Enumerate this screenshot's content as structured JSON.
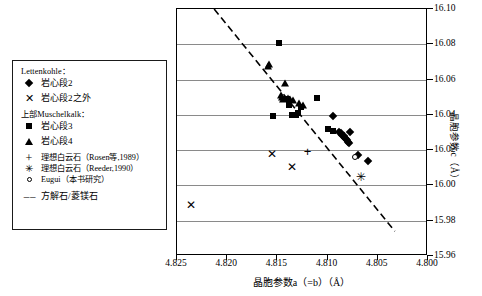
{
  "chart_data": {
    "type": "scatter",
    "title": "",
    "xlabel": "晶胞参数a（=b）（Å）",
    "ylabel": "晶胞参数c（Å）",
    "xlim": [
      4.825,
      4.8
    ],
    "ylim": [
      15.96,
      16.1
    ],
    "x_reversed": true,
    "xticks": [
      "4.825",
      "4.820",
      "4.815",
      "4.810",
      "4.805",
      "4.800"
    ],
    "xtick_values": [
      4.825,
      4.82,
      4.815,
      4.81,
      4.805,
      4.8
    ],
    "yticks": [
      "16.10",
      "16.08",
      "16.06",
      "16.04",
      "16.02",
      "16.00",
      "15.98",
      "15.96"
    ],
    "ytick_values": [
      16.1,
      16.08,
      16.06,
      16.04,
      16.02,
      16.0,
      15.98,
      15.96
    ],
    "grid": "horizontal",
    "legend_position": "outside-left",
    "series": [
      {
        "name": "岩心段2",
        "marker": "diamond",
        "points": [
          [
            4.8095,
            16.0395
          ],
          [
            4.8089,
            16.0305
          ],
          [
            4.8087,
            16.0295
          ],
          [
            4.8086,
            16.0288
          ],
          [
            4.8085,
            16.0282
          ],
          [
            4.8084,
            16.0278
          ],
          [
            4.8083,
            16.0268
          ],
          [
            4.8082,
            16.0262
          ],
          [
            4.8081,
            16.0255
          ],
          [
            4.808,
            16.0248
          ],
          [
            4.8079,
            16.0242
          ],
          [
            4.8078,
            16.0305
          ],
          [
            4.807,
            16.0175
          ],
          [
            4.806,
            16.014
          ]
        ]
      },
      {
        "name": "岩心段2之外",
        "marker": "x",
        "points": [
          [
            4.8155,
            16.0178
          ],
          [
            4.8135,
            16.0107
          ],
          [
            4.8236,
            15.9887
          ]
        ]
      },
      {
        "name": "岩心段3",
        "marker": "square",
        "points": [
          [
            4.8148,
            16.0805
          ],
          [
            4.8154,
            16.0396
          ],
          [
            4.8135,
            16.0398
          ],
          [
            4.8131,
            16.04
          ],
          [
            4.8129,
            16.0408
          ],
          [
            4.8126,
            16.0447
          ],
          [
            4.8138,
            16.0455
          ],
          [
            4.814,
            16.049
          ],
          [
            4.8111,
            16.0498
          ],
          [
            4.81,
            16.032
          ],
          [
            4.8095,
            16.0308
          ]
        ]
      },
      {
        "name": "岩心段4",
        "marker": "triangle",
        "points": [
          [
            4.8158,
            16.069
          ],
          [
            4.8159,
            16.0675
          ],
          [
            4.8142,
            16.058
          ],
          [
            4.8146,
            16.051
          ],
          [
            4.8145,
            16.05
          ],
          [
            4.8144,
            16.0492
          ],
          [
            4.8139,
            16.0498
          ],
          [
            4.8137,
            16.049
          ],
          [
            4.8134,
            16.0487
          ],
          [
            4.8128,
            16.047
          ],
          [
            4.8125,
            16.0455
          ]
        ]
      },
      {
        "name": "理想白云石（Rosen等,1989）",
        "marker": "plus",
        "points": [
          [
            4.812,
            16.0192
          ]
        ]
      },
      {
        "name": "理想白云石（Reeder,1990）",
        "marker": "star",
        "points": [
          [
            4.8067,
            16.0048
          ]
        ]
      },
      {
        "name": "Eugui（本书研究）",
        "marker": "open-circle",
        "points": [
          [
            4.8073,
            16.016
          ]
        ]
      }
    ],
    "trendline": {
      "name": "方解石/菱镁石",
      "style": "dashed",
      "x0": 4.8213,
      "y0": 16.1,
      "x1": 4.8033,
      "y1": 15.974
    }
  },
  "legend": {
    "group1_header": "Lettenkohle：",
    "group2_header": "上部Muschelkalk：",
    "entries": [
      {
        "marker": "diamond",
        "label": "岩心段2"
      },
      {
        "marker": "x",
        "label": "岩心段2之外"
      },
      {
        "marker": "square",
        "label": "岩心段3"
      },
      {
        "marker": "triangle",
        "label": "岩心段4"
      },
      {
        "marker": "plus",
        "label": "理想白云石（Rosen等,1989）"
      },
      {
        "marker": "star",
        "label": "理想白云石（Reeder,1990）"
      },
      {
        "marker": "open-circle",
        "label": "Eugui（本书研究）"
      },
      {
        "marker": "dashed-line",
        "label": "方解石/菱镁石"
      }
    ],
    "glyphs": {
      "x": "✕",
      "plus": "+",
      "star": "✳",
      "dash": "– –"
    }
  },
  "colors": {
    "marker": "#000000",
    "grid": "#8a8a8a",
    "frame": "#000000",
    "background": "#ffffff"
  }
}
